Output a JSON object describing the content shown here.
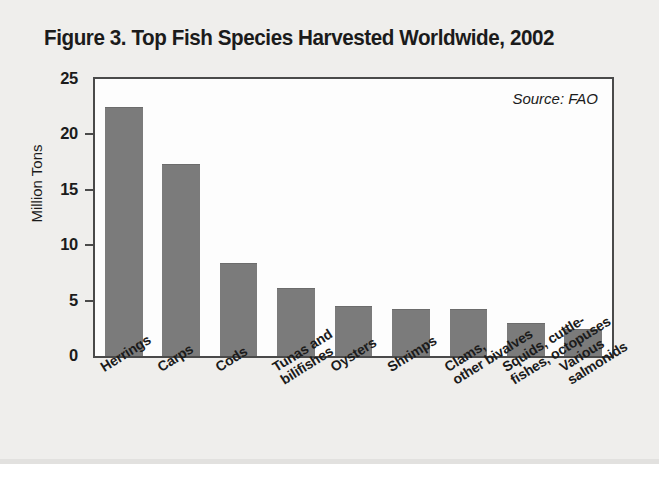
{
  "figure": {
    "title": "Figure 3. Top Fish Species Harvested Worldwide, 2002",
    "source_note": "Source: FAO"
  },
  "chart_data": {
    "type": "bar",
    "title": "Figure 3. Top Fish Species Harvested Worldwide, 2002",
    "xlabel": "",
    "ylabel": "Million Tons",
    "ylim": [
      0,
      25
    ],
    "yticks": [
      0,
      5,
      10,
      15,
      20,
      25
    ],
    "ytick_labels": [
      "0",
      "5",
      "10",
      "15",
      "20",
      "25"
    ],
    "grid": false,
    "legend": false,
    "annotations": [
      "Source: FAO"
    ],
    "units": "Million Tons",
    "year": 2002,
    "categories": [
      "Herrings",
      "Carps",
      "Cods",
      "Tunas and\nbilifishes",
      "Oysters",
      "Shrimps",
      "Clams,\nother bivalves",
      "Squids, cuttle-\nfishes, octopuses",
      "Various\nsalmonids"
    ],
    "values": [
      22.5,
      17.3,
      8.4,
      6.1,
      4.5,
      4.2,
      4.2,
      3.0,
      2.4
    ],
    "bar_color": "#7b7b7b"
  }
}
